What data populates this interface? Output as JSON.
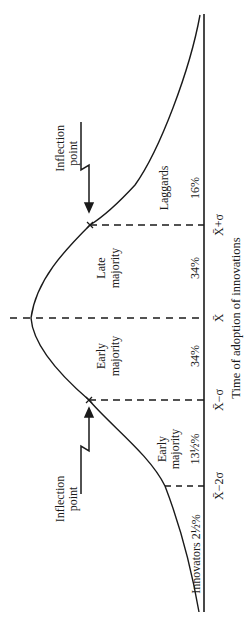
{
  "diagram": {
    "type": "bell-curve",
    "orientation": "rotated-90-ccw",
    "axis_label": "Time of adoption of innovations",
    "ticks": [
      {
        "id": "x_minus_2sigma",
        "label": "X̄−2σ"
      },
      {
        "id": "x_minus_sigma",
        "label": "X̄−σ"
      },
      {
        "id": "x_mean",
        "label": "X̄"
      },
      {
        "id": "x_plus_sigma",
        "label": "X̄+σ"
      }
    ],
    "segments": [
      {
        "id": "innovators",
        "name": "Innovators",
        "share": "2½%",
        "full": "Innovators 2½%"
      },
      {
        "id": "early_adopters",
        "name_line1": "Early",
        "name_line2": "majority",
        "share": "13½%"
      },
      {
        "id": "early_majority",
        "name_line1": "Early",
        "name_line2": "majority",
        "share": "34%"
      },
      {
        "id": "late_majority",
        "name_line1": "Late",
        "name_line2": "majority",
        "share": "34%"
      },
      {
        "id": "laggards",
        "name": "Laggards",
        "share": "16%"
      }
    ],
    "annotations": [
      {
        "id": "inflection_upper",
        "line1": "Inflection",
        "line2": "point"
      },
      {
        "id": "inflection_lower",
        "line1": "Inflection",
        "line2": "point"
      }
    ],
    "colors": {
      "ink": "#1a1a1a",
      "background": "#ffffff"
    }
  }
}
